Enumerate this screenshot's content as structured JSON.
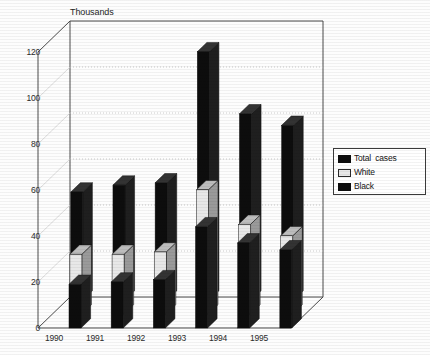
{
  "axis_title": "Thousands",
  "legend": {
    "position": "right",
    "items": [
      {
        "label": "Total  cases",
        "swatch": "black-swatch-icon",
        "color": "#0d0d0d"
      },
      {
        "label": "White",
        "swatch": "white-swatch-icon",
        "color": "#e8e8e8"
      },
      {
        "label": "Black",
        "swatch": "black-swatch-icon",
        "color": "#0d0d0d"
      }
    ]
  },
  "yticks": [
    "0",
    "20",
    "40",
    "60",
    "80",
    "100",
    "120"
  ],
  "xticks": [
    "1990",
    "1991",
    "1992",
    "1993",
    "1994",
    "1995"
  ],
  "chart_data": {
    "type": "bar",
    "title": "",
    "subtitle": "",
    "xlabel": "",
    "ylabel": "Thousands",
    "ylim": [
      0,
      120
    ],
    "ytick_values": [
      0,
      20,
      40,
      60,
      80,
      100,
      120
    ],
    "grid": true,
    "grid_axis": "y",
    "three_d": true,
    "legend_position": "right",
    "categories": [
      "1990",
      "1991",
      "1992",
      "1993",
      "1994",
      "1995"
    ],
    "series": [
      {
        "name": "Total  cases",
        "color": "#0d0d0d",
        "values": [
          47,
          50,
          51,
          108,
          81,
          76
        ]
      },
      {
        "name": "White",
        "color": "#e8e8e8",
        "values": [
          26,
          26,
          27,
          54,
          39,
          34
        ]
      },
      {
        "name": "Black",
        "color": "#0d0d0d",
        "values": [
          19,
          20,
          21,
          44,
          37,
          34
        ]
      }
    ]
  },
  "colors": {
    "bar_dark": "#0d0d0d",
    "bar_light": "#e8e8e8",
    "bar_top_dark": "#333333",
    "bar_side_dark": "#1f1f1f",
    "bar_top_light": "#bdbdbd",
    "bar_side_light": "#9a9a9a",
    "axis_line": "#4a4a4a",
    "grid_line": "#b9b9b9",
    "background": "#fdfdfd"
  }
}
